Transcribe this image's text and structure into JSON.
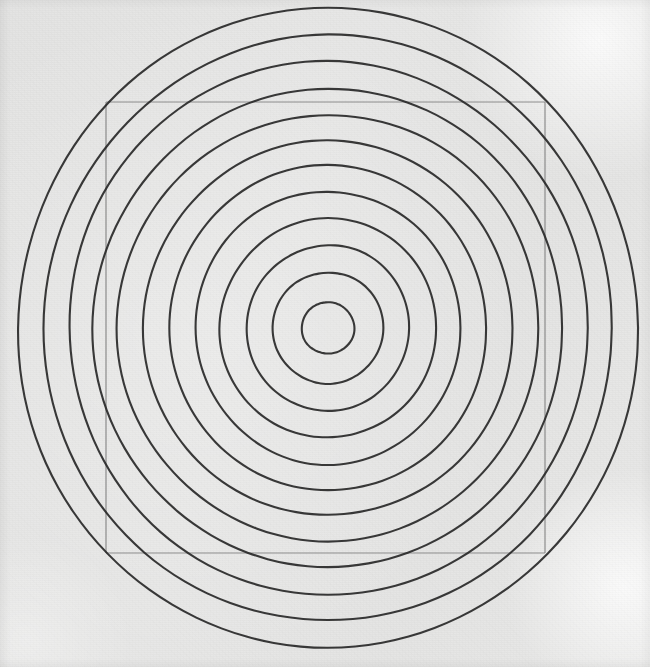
{
  "scene": {
    "title": "Concentric Circles with Inscribed Square",
    "medium": "pencil-on-paper-line-drawing",
    "canvas": {
      "width": 650,
      "height": 667
    },
    "background_color": "#e5e5e4",
    "paper_highlight_color": "#ffffff",
    "ink_color": "#2a2a2a",
    "square_color": "#808080"
  },
  "chart_data": {
    "type": "scatter",
    "xlabel": "",
    "ylabel": "",
    "xlim": [
      0,
      650
    ],
    "ylim": [
      0,
      667
    ],
    "grid": false,
    "legend": "none",
    "center": {
      "x": 328,
      "y": 328
    },
    "ring_count": 12,
    "ring_spacing_px": 26,
    "stroke_width_px": 2.1,
    "rings": [
      {
        "index": 1,
        "rx": 26,
        "ry": 26,
        "rotation": 0
      },
      {
        "index": 2,
        "rx": 55,
        "ry": 56,
        "rotation": 0
      },
      {
        "index": 3,
        "rx": 81,
        "ry": 83,
        "rotation": 0
      },
      {
        "index": 4,
        "rx": 108,
        "ry": 110,
        "rotation": 0
      },
      {
        "index": 5,
        "rx": 133,
        "ry": 136,
        "rotation": 0
      },
      {
        "index": 6,
        "rx": 159,
        "ry": 162,
        "rotation": 0
      },
      {
        "index": 7,
        "rx": 184,
        "ry": 188,
        "rotation": 0
      },
      {
        "index": 8,
        "rx": 210,
        "ry": 214,
        "rotation": 0
      },
      {
        "index": 9,
        "rx": 234,
        "ry": 240,
        "rotation": 0
      },
      {
        "index": 10,
        "rx": 260,
        "ry": 266,
        "rotation": 0
      },
      {
        "index": 11,
        "rx": 285,
        "ry": 292,
        "rotation": 0
      },
      {
        "index": 12,
        "rx": 311,
        "ry": 319,
        "rotation": 0
      }
    ],
    "square": {
      "label": "inscribed-square",
      "left": 106,
      "top": 102,
      "right": 545,
      "bottom": 553,
      "width": 439,
      "height": 451,
      "stroke_width_px": 1.2
    }
  }
}
